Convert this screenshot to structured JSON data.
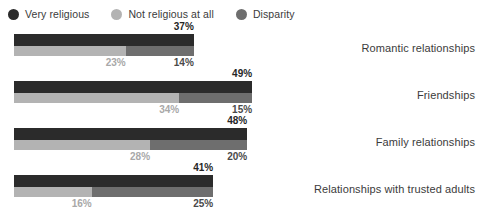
{
  "legend": {
    "items": [
      {
        "label": "Very religious",
        "color": "#2b2b2b",
        "icon": "circle-icon"
      },
      {
        "label": "Not religious at all",
        "color": "#b3b3b3",
        "icon": "circle-icon"
      },
      {
        "label": "Disparity",
        "color": "#6e6e6e",
        "icon": "circle-icon"
      }
    ]
  },
  "chart_data": {
    "type": "bar",
    "orientation": "horizontal",
    "title": "",
    "xlabel": "",
    "ylabel": "",
    "xlim": [
      0,
      55
    ],
    "grid": false,
    "legend_position": "top-left",
    "value_suffix": "%",
    "categories": [
      "Romantic relationships",
      "Friendships",
      "Family relationships",
      "Relationships with trusted adults"
    ],
    "series": [
      {
        "name": "Very religious",
        "color": "#2b2b2b",
        "values": [
          37,
          49,
          48,
          41
        ]
      },
      {
        "name": "Not religious at all",
        "color": "#b3b3b3",
        "values": [
          23,
          34,
          28,
          16
        ]
      },
      {
        "name": "Disparity",
        "color": "#6e6e6e",
        "values": [
          14,
          15,
          20,
          25
        ]
      }
    ],
    "value_labels": {
      "very_religious": [
        "37%",
        "49%",
        "48%",
        "41%"
      ],
      "not_religious_at_all": [
        "23%",
        "34%",
        "28%",
        "16%"
      ],
      "disparity": [
        "14%",
        "15%",
        "20%",
        "25%"
      ]
    }
  }
}
